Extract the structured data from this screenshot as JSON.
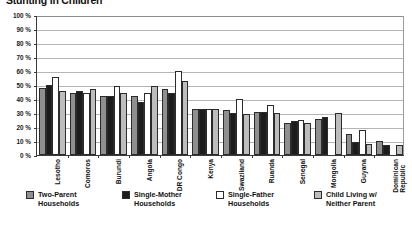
{
  "chart_data": {
    "type": "bar",
    "title": "Stunting in Children",
    "xlabel": "",
    "ylabel": "",
    "ylim": [
      0,
      100
    ],
    "ytick_labels": [
      "100 %",
      "90 %",
      "80 %",
      "70 %",
      "60 %",
      "50 %",
      "40 %",
      "30 %",
      "20 %",
      "10 %",
      "0 %"
    ],
    "ytick_values": [
      100,
      90,
      80,
      70,
      60,
      50,
      40,
      30,
      20,
      10,
      0
    ],
    "grid": true,
    "legend_position": "bottom",
    "categories": [
      "Lesotho",
      "Comoros",
      "Burundi",
      "Angola",
      "DR Congo",
      "Kenya",
      "Swaziland",
      "Ruanda",
      "Senegal",
      "Mongolia",
      "Guyana",
      "Dominican\nRepublic"
    ],
    "series": [
      {
        "name": "Two-Parent\nHouseholds",
        "color": "#8f8f8f",
        "values": [
          48,
          44,
          42,
          42,
          47,
          33,
          32,
          31,
          23,
          26,
          15,
          10
        ]
      },
      {
        "name": "Single-Mother\nHouseholds",
        "color": "#1c1c1c",
        "values": [
          50,
          46,
          42,
          38,
          44,
          33,
          30,
          31,
          24,
          27,
          9,
          7
        ]
      },
      {
        "name": "Single-Father\nHouseholds",
        "color": "#ffffff",
        "values": [
          56,
          44,
          49,
          44,
          60,
          33,
          40,
          36,
          25,
          0,
          18,
          0
        ]
      },
      {
        "name": "Child Living w/\nNeither Parent",
        "color": "#bdbdbd",
        "values": [
          46,
          47,
          44,
          49,
          53,
          33,
          29,
          30,
          23,
          30,
          8,
          7
        ]
      }
    ]
  },
  "legend": {
    "items": [
      {
        "label": "Two-Parent\nHouseholds",
        "swatch": "#8f8f8f"
      },
      {
        "label": "Single-Mother\nHouseholds",
        "swatch": "#1c1c1c"
      },
      {
        "label": "Single-Father\nHouseholds",
        "swatch": "#ffffff"
      },
      {
        "label": "Child Living w/\nNeither Parent",
        "swatch": "#bdbdbd"
      }
    ]
  }
}
